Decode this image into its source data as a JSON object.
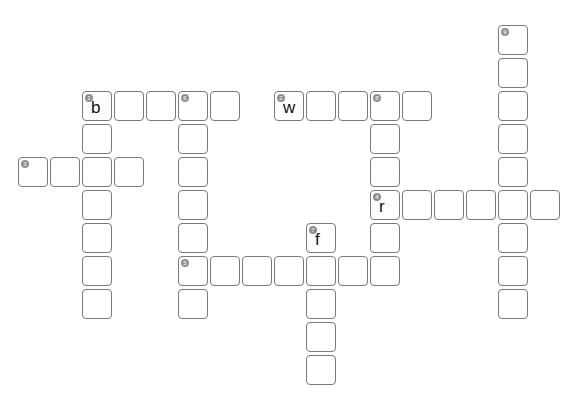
{
  "grid": {
    "origin_x": 18,
    "origin_y": 25,
    "pitch_x": 32,
    "pitch_y": 33
  },
  "colors": {
    "cell_border": "#7a7a7a",
    "number_badge": "#8f8f8f",
    "letter": "#111111"
  },
  "entries": [
    {
      "number": "1",
      "direction": "down",
      "col": 2,
      "row": 2,
      "length": 7
    },
    {
      "number": "1",
      "direction": "across",
      "col": 2,
      "row": 2,
      "length": 5
    },
    {
      "number": "2",
      "direction": "across",
      "col": 8,
      "row": 2,
      "length": 5
    },
    {
      "number": "3",
      "direction": "across",
      "col": 0,
      "row": 4,
      "length": 4
    },
    {
      "number": "4",
      "direction": "across",
      "col": 11,
      "row": 5,
      "length": 6
    },
    {
      "number": "5",
      "direction": "across",
      "col": 5,
      "row": 7,
      "length": 7
    },
    {
      "number": "6",
      "direction": "down",
      "col": 5,
      "row": 2,
      "length": 7
    },
    {
      "number": "7",
      "direction": "down",
      "col": 9,
      "row": 6,
      "length": 5
    },
    {
      "number": "8",
      "direction": "down",
      "col": 11,
      "row": 2,
      "length": 6
    },
    {
      "number": "9",
      "direction": "down",
      "col": 15,
      "row": 0,
      "length": 9
    }
  ],
  "numbered_cells": [
    {
      "number": "9",
      "col": 15,
      "row": 0
    },
    {
      "number": "1",
      "col": 2,
      "row": 2
    },
    {
      "number": "6",
      "col": 5,
      "row": 2
    },
    {
      "number": "2",
      "col": 8,
      "row": 2
    },
    {
      "number": "8",
      "col": 11,
      "row": 2
    },
    {
      "number": "3",
      "col": 0,
      "row": 4
    },
    {
      "number": "4",
      "col": 11,
      "row": 5
    },
    {
      "number": "7",
      "col": 9,
      "row": 6
    },
    {
      "number": "5",
      "col": 5,
      "row": 7
    }
  ],
  "filled_letters": [
    {
      "col": 2,
      "row": 2,
      "letter": "b"
    },
    {
      "col": 8,
      "row": 2,
      "letter": "w"
    },
    {
      "col": 11,
      "row": 5,
      "letter": "r"
    },
    {
      "col": 9,
      "row": 6,
      "letter": "f"
    }
  ]
}
